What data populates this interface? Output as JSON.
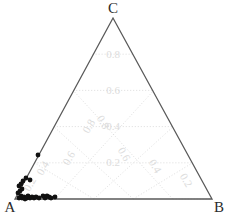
{
  "chart_data": {
    "type": "scatter",
    "plot_kind": "ternary-diagram",
    "title": "",
    "vertices": [
      {
        "id": "A",
        "label": "A",
        "x": 15,
        "y": 199
      },
      {
        "id": "B",
        "label": "B",
        "x": 212,
        "y": 199
      },
      {
        "id": "C",
        "label": "C",
        "x": 113,
        "y": 18
      }
    ],
    "axis_ticks": [
      0.2,
      0.4,
      0.6,
      0.8
    ],
    "tick_labels": [
      "0.2",
      "0.4",
      "0.6",
      "0.8"
    ],
    "grid": true,
    "grid_style": "dotted",
    "grid_color": "#d9d9d9",
    "outline_color": "#595959",
    "point_color": "#111111",
    "point_marker": "circle",
    "xlabel": "",
    "ylabel": "",
    "legend": "none",
    "axis_range": [
      0,
      1
    ],
    "n_points": 27,
    "points": [
      {
        "a": 0.985,
        "b": 0.012,
        "c": 0.003
      },
      {
        "a": 0.972,
        "b": 0.02,
        "c": 0.008
      },
      {
        "a": 0.965,
        "b": 0.03,
        "c": 0.005
      },
      {
        "a": 0.958,
        "b": 0.038,
        "c": 0.004
      },
      {
        "a": 0.95,
        "b": 0.046,
        "c": 0.004
      },
      {
        "a": 0.944,
        "b": 0.05,
        "c": 0.006
      },
      {
        "a": 0.938,
        "b": 0.056,
        "c": 0.006
      },
      {
        "a": 0.93,
        "b": 0.064,
        "c": 0.006
      },
      {
        "a": 0.922,
        "b": 0.072,
        "c": 0.006
      },
      {
        "a": 0.915,
        "b": 0.08,
        "c": 0.005
      },
      {
        "a": 0.905,
        "b": 0.09,
        "c": 0.005
      },
      {
        "a": 0.896,
        "b": 0.1,
        "c": 0.004
      },
      {
        "a": 0.88,
        "b": 0.116,
        "c": 0.004
      },
      {
        "a": 0.868,
        "b": 0.128,
        "c": 0.004
      },
      {
        "a": 0.855,
        "b": 0.141,
        "c": 0.004
      },
      {
        "a": 0.842,
        "b": 0.154,
        "c": 0.004
      },
      {
        "a": 0.83,
        "b": 0.166,
        "c": 0.004
      },
      {
        "a": 0.812,
        "b": 0.184,
        "c": 0.004
      },
      {
        "a": 0.958,
        "b": 0.01,
        "c": 0.032
      },
      {
        "a": 0.948,
        "b": 0.018,
        "c": 0.034
      },
      {
        "a": 0.936,
        "b": 0.024,
        "c": 0.04
      },
      {
        "a": 0.922,
        "b": 0.016,
        "c": 0.062
      },
      {
        "a": 0.906,
        "b": 0.022,
        "c": 0.072
      },
      {
        "a": 0.88,
        "b": 0.03,
        "c": 0.09
      },
      {
        "a": 0.845,
        "b": 0.028,
        "c": 0.127
      },
      {
        "a": 0.8,
        "b": 0.02,
        "c": 0.18
      },
      {
        "a": 0.74,
        "b": 0.012,
        "c": 0.248
      }
    ],
    "pixel_points": [
      {
        "x": 19,
        "y": 198
      },
      {
        "x": 21,
        "y": 196
      },
      {
        "x": 22,
        "y": 198
      },
      {
        "x": 24,
        "y": 197
      },
      {
        "x": 25,
        "y": 199
      },
      {
        "x": 27,
        "y": 198
      },
      {
        "x": 28,
        "y": 196
      },
      {
        "x": 30,
        "y": 198
      },
      {
        "x": 32,
        "y": 197
      },
      {
        "x": 34,
        "y": 198
      },
      {
        "x": 36,
        "y": 197
      },
      {
        "x": 39,
        "y": 198
      },
      {
        "x": 43,
        "y": 196
      },
      {
        "x": 45,
        "y": 198
      },
      {
        "x": 47,
        "y": 196
      },
      {
        "x": 49,
        "y": 197
      },
      {
        "x": 51,
        "y": 198
      },
      {
        "x": 55,
        "y": 197
      },
      {
        "x": 18,
        "y": 193
      },
      {
        "x": 20,
        "y": 191
      },
      {
        "x": 22,
        "y": 189
      },
      {
        "x": 19,
        "y": 186
      },
      {
        "x": 21,
        "y": 184
      },
      {
        "x": 23,
        "y": 181
      },
      {
        "x": 26,
        "y": 178
      },
      {
        "x": 30,
        "y": 180
      },
      {
        "x": 38,
        "y": 155
      }
    ]
  },
  "labels": {
    "vertex_a": "A",
    "vertex_b": "B",
    "vertex_c": "C",
    "tick_02": "0.2",
    "tick_04": "0.4",
    "tick_06": "0.6",
    "tick_08": "0.8"
  }
}
